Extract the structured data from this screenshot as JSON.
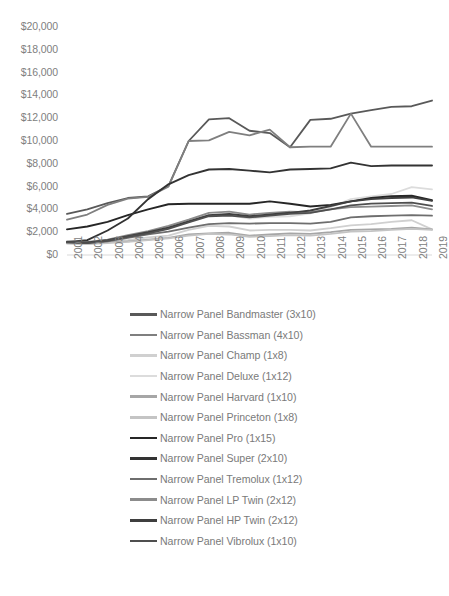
{
  "chart_data": {
    "type": "line",
    "title": "",
    "xlabel": "",
    "ylabel": "",
    "grid": false,
    "legend_position": "bottom",
    "x": [
      2001,
      2002,
      2003,
      2004,
      2005,
      2006,
      2007,
      2008,
      2009,
      2010,
      2011,
      2012,
      2013,
      2014,
      2015,
      2016,
      2017,
      2018,
      2019
    ],
    "xtick_labels": [
      "2001",
      "2002",
      "2003",
      "2004",
      "2005",
      "2006",
      "2007",
      "2008",
      "2009",
      "2010",
      "2011",
      "2012",
      "2013",
      "2014",
      "2015",
      "2016",
      "2017",
      "2018",
      "2019"
    ],
    "ytick_labels": [
      "$0",
      "$2,000",
      "$4,000",
      "$6,000",
      "$8,000",
      "$10,000",
      "$12,000",
      "$14,000",
      "$16,000",
      "$18,000",
      "$20,000"
    ],
    "ytick_values": [
      0,
      2000,
      4000,
      6000,
      8000,
      10000,
      12000,
      14000,
      16000,
      18000,
      20000
    ],
    "ylim": [
      0,
      20000
    ],
    "xlim": [
      2001,
      2019
    ],
    "series": [
      {
        "name": "Narrow Panel Bandmaster (3x10)",
        "color": "#595959",
        "width": 1.8,
        "values": [
          3600,
          4000,
          4550,
          5000,
          5150,
          6050,
          10000,
          11900,
          12000,
          10900,
          10700,
          9450,
          11850,
          11950,
          12400,
          12700,
          13000,
          13050,
          13550
        ]
      },
      {
        "name": "Narrow Panel Bassman (4x10)",
        "color": "#7f7f7f",
        "width": 1.8,
        "values": [
          3100,
          3550,
          4400,
          4950,
          5100,
          6000,
          10000,
          10050,
          10800,
          10500,
          11000,
          9450,
          9500,
          9500,
          12400,
          9500,
          9500,
          9500,
          9500
        ]
      },
      {
        "name": "Narrow Panel Champ (1x8)",
        "color": "#d0d0d0",
        "width": 1.8,
        "values": [
          1050,
          1000,
          1150,
          1300,
          1550,
          1700,
          2200,
          2550,
          2500,
          2150,
          2200,
          2200,
          2150,
          2350,
          2600,
          2700,
          2900,
          3050,
          2250
        ]
      },
      {
        "name": "Narrow Panel Deluxe (1x12)",
        "color": "#dcdcdc",
        "width": 1.8,
        "values": [
          1100,
          1050,
          1200,
          1550,
          1850,
          2350,
          2900,
          3450,
          3500,
          3200,
          3350,
          3400,
          3650,
          4200,
          4900,
          5150,
          5350,
          5950,
          5750
        ]
      },
      {
        "name": "Narrow Panel Harvard (1x10)",
        "color": "#a6a6a6",
        "width": 1.8,
        "values": [
          1050,
          1000,
          1100,
          1200,
          1350,
          1500,
          1800,
          1900,
          1950,
          1700,
          1800,
          1900,
          1850,
          2000,
          2200,
          2250,
          2300,
          2400,
          2250
        ]
      },
      {
        "name": "Narrow Panel Princeton (1x8)",
        "color": "#c4c4c4",
        "width": 1.8,
        "values": [
          1000,
          950,
          1050,
          1150,
          1300,
          1450,
          1700,
          1850,
          1800,
          1600,
          1650,
          1750,
          1700,
          1850,
          2050,
          2100,
          2200,
          2300,
          2200
        ]
      },
      {
        "name": "Narrow Panel Pro (1x15)",
        "color": "#262626",
        "width": 1.9,
        "values": [
          2250,
          2500,
          2900,
          3500,
          4000,
          4450,
          4500,
          4500,
          4500,
          4500,
          4700,
          4500,
          4250,
          4400,
          4700,
          5000,
          5150,
          5200,
          4800
        ]
      },
      {
        "name": "Narrow Panel Super (2x10)",
        "color": "#333333",
        "width": 1.9,
        "values": [
          1150,
          1300,
          2150,
          3200,
          4900,
          6200,
          7000,
          7500,
          7550,
          7400,
          7250,
          7500,
          7550,
          7600,
          8100,
          7800,
          7850,
          7850,
          7850
        ]
      },
      {
        "name": "Narrow Panel Tremolux (1x12)",
        "color": "#6e6e6e",
        "width": 1.8,
        "values": [
          1100,
          1050,
          1200,
          1500,
          1800,
          2050,
          2400,
          2700,
          2800,
          2750,
          2800,
          2800,
          2750,
          2900,
          3300,
          3400,
          3450,
          3500,
          3450
        ]
      },
      {
        "name": "Narrow Panel LP Twin (2x12)",
        "color": "#8c8c8c",
        "width": 1.8,
        "values": [
          1200,
          1150,
          1350,
          1750,
          2100,
          2550,
          3100,
          3700,
          3800,
          3550,
          3700,
          3800,
          3750,
          4000,
          4200,
          4250,
          4300,
          4350,
          4000
        ]
      },
      {
        "name": "Narrow Panel HP Twin (2x12)",
        "color": "#3f3f3f",
        "width": 1.9,
        "values": [
          1150,
          1100,
          1300,
          1650,
          2000,
          2400,
          2950,
          3500,
          3600,
          3400,
          3550,
          3700,
          3900,
          4300,
          4700,
          4900,
          5000,
          5050,
          4750
        ]
      },
      {
        "name": "Narrow Panel Vibrolux (1x10)",
        "color": "#4f4f4f",
        "width": 1.8,
        "values": [
          1100,
          1050,
          1250,
          1600,
          1900,
          2300,
          2850,
          3400,
          3450,
          3300,
          3450,
          3600,
          3700,
          4000,
          4350,
          4500,
          4550,
          4600,
          4300
        ]
      }
    ]
  }
}
